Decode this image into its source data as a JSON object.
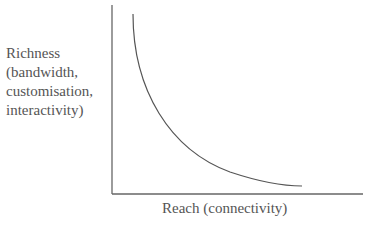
{
  "diagram": {
    "y_axis_label": [
      "Richness",
      "(bandwidth,",
      "customisation,",
      "interactivity)"
    ],
    "x_axis_label": "Reach (connectivity)",
    "curve": "richness-reach trade-off curve",
    "colors": {
      "axis": "#666666",
      "curve": "#555555",
      "text": "#555555"
    }
  }
}
